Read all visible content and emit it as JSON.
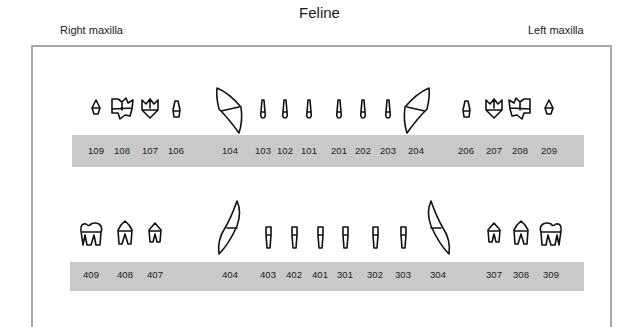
{
  "title": "Feline",
  "labels": {
    "right_maxilla": "Right maxilla",
    "left_maxilla": "Left maxilla"
  },
  "colors": {
    "bar": "#c9c9c9",
    "border": "#a8a8a8",
    "outline": "#111111"
  },
  "upper_arch": {
    "teeth": [
      {
        "id": "109",
        "type": "molar-small",
        "x": 96
      },
      {
        "id": "108",
        "type": "premolar-large",
        "x": 122
      },
      {
        "id": "107",
        "type": "premolar",
        "x": 150
      },
      {
        "id": "106",
        "type": "premolar-tiny",
        "x": 176
      },
      {
        "id": "104",
        "type": "canine",
        "x": 230
      },
      {
        "id": "103",
        "type": "incisor",
        "x": 263
      },
      {
        "id": "102",
        "type": "incisor",
        "x": 285
      },
      {
        "id": "101",
        "type": "incisor",
        "x": 309
      },
      {
        "id": "201",
        "type": "incisor",
        "x": 339
      },
      {
        "id": "202",
        "type": "incisor",
        "x": 363
      },
      {
        "id": "203",
        "type": "incisor",
        "x": 388
      },
      {
        "id": "204",
        "type": "canine",
        "x": 416
      },
      {
        "id": "206",
        "type": "premolar-tiny",
        "x": 466
      },
      {
        "id": "207",
        "type": "premolar",
        "x": 494
      },
      {
        "id": "208",
        "type": "premolar-large",
        "x": 520
      },
      {
        "id": "209",
        "type": "molar-small",
        "x": 549
      }
    ]
  },
  "lower_arch": {
    "teeth": [
      {
        "id": "409",
        "type": "molar",
        "x": 91
      },
      {
        "id": "408",
        "type": "premolar",
        "x": 125
      },
      {
        "id": "407",
        "type": "premolar-small",
        "x": 155
      },
      {
        "id": "404",
        "type": "canine",
        "x": 230
      },
      {
        "id": "403",
        "type": "incisor",
        "x": 268
      },
      {
        "id": "402",
        "type": "incisor",
        "x": 294
      },
      {
        "id": "401",
        "type": "incisor",
        "x": 320
      },
      {
        "id": "301",
        "type": "incisor",
        "x": 345
      },
      {
        "id": "302",
        "type": "incisor",
        "x": 375
      },
      {
        "id": "303",
        "type": "incisor",
        "x": 403
      },
      {
        "id": "304",
        "type": "canine",
        "x": 438
      },
      {
        "id": "307",
        "type": "premolar-small",
        "x": 494
      },
      {
        "id": "308",
        "type": "premolar",
        "x": 521
      },
      {
        "id": "309",
        "type": "molar",
        "x": 551
      }
    ]
  }
}
